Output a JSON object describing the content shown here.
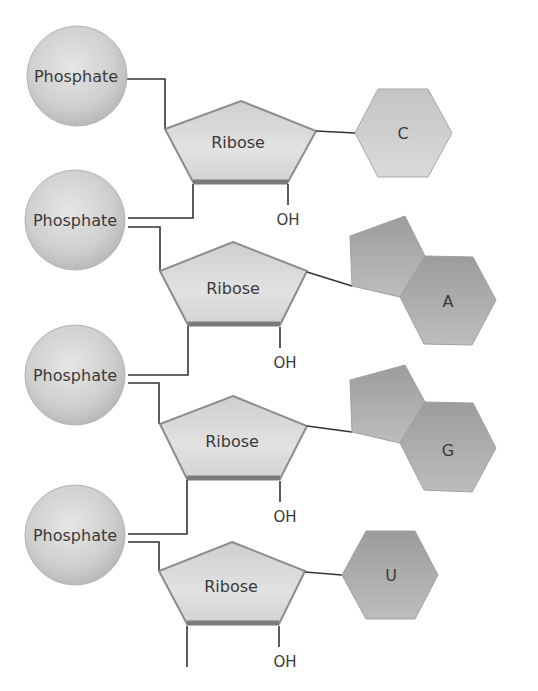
{
  "diagram": {
    "labels": {
      "phosphate": "Phosphate",
      "ribose": "Ribose",
      "hydroxyl": "OH"
    },
    "nucleotides": [
      {
        "phosphate": "Phosphate",
        "sugar": "Ribose",
        "oh": "OH",
        "base": "C",
        "base_type": "pyrimidine"
      },
      {
        "phosphate": "Phosphate",
        "sugar": "Ribose",
        "oh": "OH",
        "base": "A",
        "base_type": "purine"
      },
      {
        "phosphate": "Phosphate",
        "sugar": "Ribose",
        "oh": "OH",
        "base": "G",
        "base_type": "purine"
      },
      {
        "phosphate": "Phosphate",
        "sugar": "Ribose",
        "oh": "OH",
        "base": "U",
        "base_type": "pyrimidine"
      }
    ],
    "colors": {
      "phosphate_fill": "#d0d0d0",
      "ribose_fill": "#d6d6d6",
      "ribose_edge": "#8c8c8c",
      "pyrimidine_fill": "#c9c9c9",
      "purine_fill": "#a9a9a9",
      "line": "#333333"
    }
  }
}
